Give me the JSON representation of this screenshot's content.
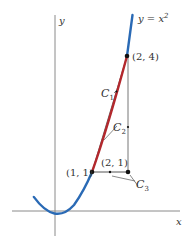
{
  "diagram": {
    "curve_label": "y = x",
    "curve_exponent": "2",
    "axes": {
      "x_label": "x",
      "y_label": "y"
    },
    "points": [
      {
        "id": "p11",
        "label": "(1, 1)"
      },
      {
        "id": "p21",
        "label": "(2, 1)"
      },
      {
        "id": "p24",
        "label": "(2, 4)"
      }
    ],
    "paths": [
      {
        "id": "C1",
        "label": "C",
        "subscript": "1",
        "description": "straight segment from (1,1) to (2,4)"
      },
      {
        "id": "C2",
        "label": "C",
        "subscript": "2",
        "description": "parabola y = x^2 from (1,1) to (2,4)"
      },
      {
        "id": "C3",
        "label": "C",
        "subscript": "3",
        "description": "horizontal then vertical path via (2,1)"
      }
    ],
    "colors": {
      "parabola": "#2a6ab5",
      "highlighted_arc": "#b3282d",
      "axes": "#888888",
      "lines": "#555555",
      "points": "#111111"
    }
  }
}
